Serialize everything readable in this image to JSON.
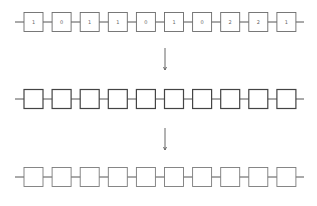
{
  "diagram": {
    "rows": [
      {
        "name": "input-sequence",
        "cells": [
          "1",
          "0",
          "1",
          "1",
          "0",
          "1",
          "0",
          "2",
          "2",
          "1"
        ],
        "style": "thin"
      },
      {
        "name": "intermediate-sequence",
        "cells": [
          "",
          "",
          "",
          "",
          "",
          "",
          "",
          "",
          "",
          ""
        ],
        "style": "bold"
      },
      {
        "name": "output-sequence",
        "cells": [
          "",
          "",
          "",
          "",
          "",
          "",
          "",
          "",
          "",
          ""
        ],
        "style": "light"
      }
    ],
    "arrows": [
      {
        "from": "input-sequence",
        "to": "intermediate-sequence"
      },
      {
        "from": "intermediate-sequence",
        "to": "output-sequence"
      }
    ]
  }
}
